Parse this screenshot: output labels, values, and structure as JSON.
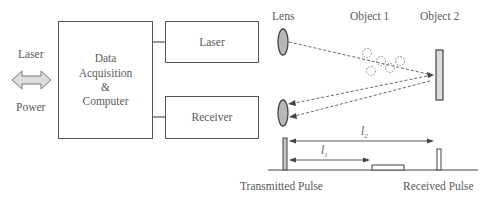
{
  "left_io": {
    "top_label": "Laser",
    "bottom_label": "Power",
    "arrow_icon": "double-arrow"
  },
  "blocks": {
    "daq": {
      "line1": "Data",
      "line2": "Acquisition",
      "line3": "&",
      "line4": "Computer"
    },
    "laser": {
      "label": "Laser"
    },
    "receiver": {
      "label": "Receiver"
    }
  },
  "optics": {
    "lens_label": "Lens",
    "object1_label": "Object 1",
    "object2_label": "Object 2"
  },
  "timing": {
    "l1_label": "l",
    "l1_sub": "1",
    "l2_label": "l",
    "l2_sub": "2",
    "transmitted_label": "Transmitted Pulse",
    "received_label": "Received Pulse"
  },
  "colors": {
    "stroke": "#555555",
    "fill_gray": "#c8c8c8",
    "fill_light": "#dcdcdc",
    "text": "#5a5a5a"
  }
}
